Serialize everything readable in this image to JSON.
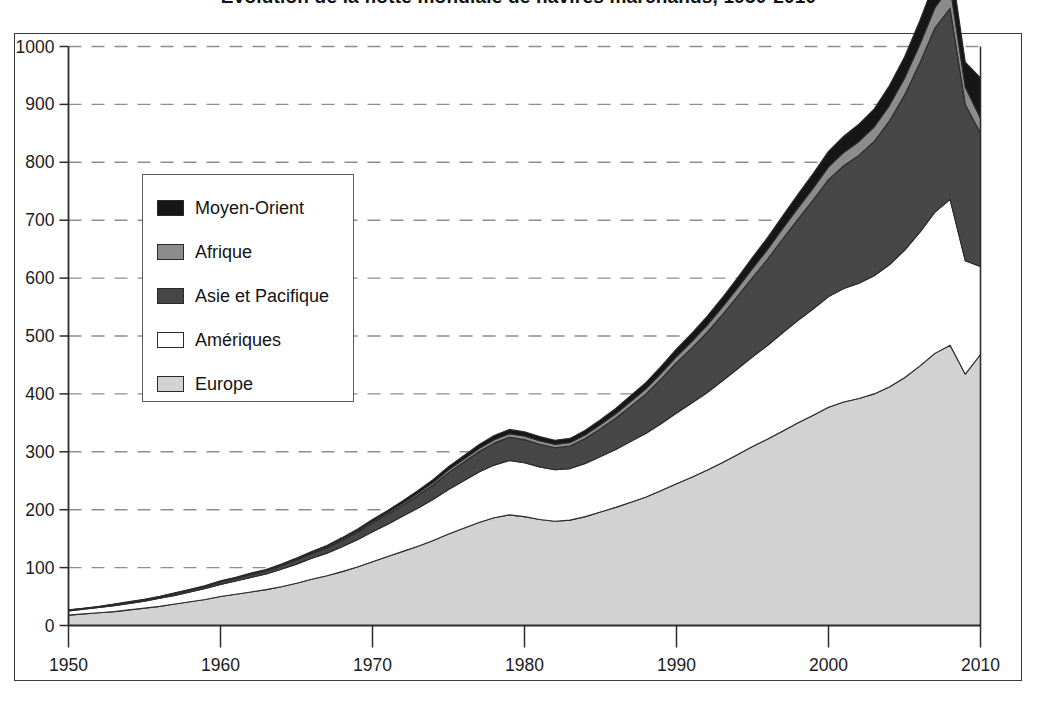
{
  "title": "Évolution de la flotte mondiale de navires marchands, 1950-2010",
  "legend": {
    "position": "inside-upper-left",
    "items": [
      {
        "label": "Moyen-Orient",
        "color": "#161616"
      },
      {
        "label": "Afrique",
        "color": "#8c8c8c"
      },
      {
        "label": "Asie et Pacifique",
        "color": "#474747"
      },
      {
        "label": "Amériques",
        "color": "#ffffff"
      },
      {
        "label": "Europe",
        "color": "#d2d2d2"
      }
    ]
  },
  "axes": {
    "y_ticks": [
      "0",
      "100",
      "200",
      "300",
      "400",
      "500",
      "600",
      "700",
      "800",
      "900",
      "1000"
    ],
    "x_ticks": [
      "1950",
      "1960",
      "1970",
      "1980",
      "1990",
      "2000",
      "2010"
    ],
    "ylim": [
      0,
      1000
    ],
    "xlim": [
      1950,
      2010
    ],
    "grid": "horizontal-dashed"
  },
  "chart_data": {
    "type": "area",
    "stacked": true,
    "title": "Évolution de la flotte mondiale de navires marchands, 1950-2010",
    "xlabel": "",
    "ylabel": "",
    "xlim": [
      1950,
      2010
    ],
    "ylim": [
      0,
      1000
    ],
    "grid": true,
    "legend_position": "inside-upper-left",
    "x": [
      1950,
      1951,
      1952,
      1953,
      1954,
      1955,
      1956,
      1957,
      1958,
      1959,
      1960,
      1961,
      1962,
      1963,
      1964,
      1965,
      1966,
      1967,
      1968,
      1969,
      1970,
      1971,
      1972,
      1973,
      1974,
      1975,
      1976,
      1977,
      1978,
      1979,
      1980,
      1981,
      1982,
      1983,
      1984,
      1985,
      1986,
      1987,
      1988,
      1989,
      1990,
      1991,
      1992,
      1993,
      1994,
      1995,
      1996,
      1997,
      1998,
      1999,
      2000,
      2001,
      2002,
      2003,
      2004,
      2005,
      2006,
      2007,
      2008,
      2009,
      2010
    ],
    "series": [
      {
        "name": "Europe",
        "color": "#d2d2d2",
        "values": [
          18,
          20,
          22,
          24,
          27,
          30,
          33,
          37,
          41,
          45,
          50,
          54,
          58,
          62,
          67,
          73,
          80,
          86,
          93,
          101,
          110,
          119,
          128,
          137,
          147,
          158,
          168,
          178,
          186,
          191,
          188,
          183,
          180,
          182,
          188,
          196,
          204,
          213,
          222,
          233,
          245,
          256,
          268,
          281,
          295,
          309,
          322,
          336,
          350,
          363,
          377,
          386,
          392,
          400,
          412,
          428,
          448,
          470,
          484,
          434,
          468
        ]
      },
      {
        "name": "Amériques",
        "color": "#ffffff",
        "values": [
          7,
          8,
          9,
          10,
          11,
          12,
          14,
          15,
          17,
          19,
          21,
          23,
          25,
          27,
          30,
          33,
          36,
          39,
          43,
          47,
          52,
          56,
          61,
          66,
          71,
          77,
          82,
          87,
          91,
          94,
          93,
          91,
          89,
          89,
          92,
          96,
          100,
          105,
          110,
          116,
          122,
          128,
          134,
          141,
          148,
          155,
          162,
          170,
          177,
          184,
          191,
          196,
          199,
          204,
          211,
          220,
          231,
          244,
          252,
          196,
          152
        ]
      },
      {
        "name": "Asie et Pacifique",
        "color": "#474747",
        "values": [
          1,
          1,
          1,
          2,
          2,
          2,
          2,
          3,
          3,
          3,
          4,
          4,
          5,
          5,
          6,
          7,
          8,
          9,
          11,
          13,
          15,
          17,
          19,
          22,
          25,
          29,
          32,
          35,
          38,
          40,
          40,
          39,
          38,
          39,
          43,
          48,
          54,
          61,
          68,
          77,
          87,
          95,
          104,
          114,
          125,
          137,
          149,
          162,
          175,
          188,
          202,
          212,
          221,
          232,
          248,
          268,
          292,
          318,
          330,
          270,
          230
        ]
      },
      {
        "name": "Afrique",
        "color": "#8c8c8c",
        "values": [
          0.5,
          0.5,
          0.5,
          0.6,
          0.6,
          0.7,
          0.7,
          0.8,
          0.8,
          0.9,
          1.0,
          1.1,
          1.2,
          1.3,
          1.4,
          1.6,
          1.8,
          2.0,
          2.2,
          2.5,
          2.8,
          3.1,
          3.4,
          3.8,
          4.2,
          4.7,
          5.1,
          5.5,
          5.9,
          6.2,
          6.2,
          6.0,
          5.9,
          6.0,
          6.5,
          7.0,
          7.6,
          8.3,
          9.0,
          9.8,
          10.6,
          11.4,
          12.3,
          13.3,
          14.4,
          15.6,
          16.8,
          18.1,
          19.4,
          20.7,
          22,
          23,
          24,
          25,
          27,
          29,
          32,
          35,
          37,
          30,
          26
        ]
      },
      {
        "name": "Moyen-Orient",
        "color": "#161616",
        "values": [
          0.4,
          0.4,
          0.5,
          0.5,
          0.6,
          0.6,
          0.7,
          0.8,
          0.9,
          1.0,
          1.1,
          1.2,
          1.3,
          1.5,
          1.6,
          1.8,
          2.0,
          2.3,
          2.6,
          2.9,
          3.3,
          3.7,
          4.1,
          4.6,
          5.1,
          5.7,
          6.2,
          6.7,
          7.1,
          7.5,
          7.5,
          7.3,
          7.1,
          7.2,
          7.8,
          8.5,
          9.2,
          10.1,
          11.0,
          12.0,
          13.0,
          14.1,
          15.2,
          16.4,
          17.7,
          19.1,
          20.5,
          22.0,
          23.6,
          25.2,
          27,
          28,
          30,
          31,
          34,
          37,
          41,
          46,
          50,
          43,
          70
        ]
      }
    ]
  }
}
